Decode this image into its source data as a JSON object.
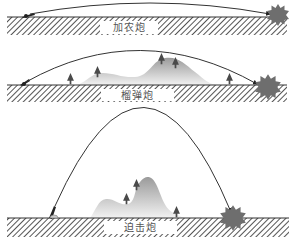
{
  "diagram": {
    "panels": [
      {
        "id": "gun",
        "label": "加农炮",
        "trajectory": "flat",
        "ground_y": 17,
        "arc": {
          "start": [
            25,
            16
          ],
          "control": [
            150,
            -8
          ],
          "end": [
            270,
            15
          ]
        },
        "trees": [],
        "hills": false
      },
      {
        "id": "howitzer",
        "label": "榴弹炮",
        "trajectory": "medium-arc",
        "ground_y": 85,
        "arc": {
          "start": [
            22,
            85
          ],
          "control": [
            140,
            18
          ],
          "end": [
            258,
            84
          ]
        },
        "trees": [
          [
            70,
            85
          ],
          [
            98,
            78
          ],
          [
            162,
            66
          ],
          [
            176,
            70
          ],
          [
            230,
            85
          ]
        ],
        "hills": true
      },
      {
        "id": "mortar",
        "label": "迫击炮",
        "trajectory": "high-arc",
        "ground_y": 218,
        "arc": {
          "start": [
            50,
            217
          ],
          "control": [
            145,
            6
          ],
          "end": [
            232,
            216
          ]
        },
        "trees": [
          [
            127,
            204
          ],
          [
            137,
            190
          ],
          [
            177,
            218
          ]
        ],
        "hills": true
      }
    ],
    "colors": {
      "ground_line": "#333333",
      "hatch": "#555555",
      "trajectory": "#333333",
      "explosion": "#6e6e6e",
      "hill_top": "#9a9a9a",
      "hill_bottom": "#f2f2f2",
      "tree": "#4a4a4a"
    }
  }
}
